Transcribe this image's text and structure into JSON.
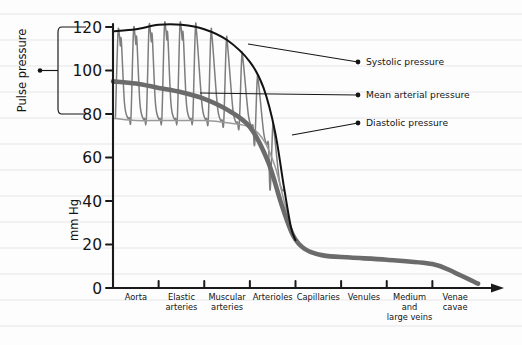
{
  "figure": {
    "y_axis_title": "mm Hg",
    "pulse_pressure_label": "Pulse pressure"
  },
  "annotations": [
    {
      "id": "systolic",
      "label": "Systolic pressure"
    },
    {
      "id": "mean",
      "label": "Mean arterial pressure"
    },
    {
      "id": "diastolic",
      "label": "Diastolic pressure"
    }
  ],
  "chart_data": {
    "type": "line",
    "title": "",
    "subtitle": "",
    "xlabel": "",
    "ylabel": "mm Hg",
    "ylim": [
      0,
      125
    ],
    "yticks": [
      0,
      20,
      40,
      60,
      80,
      100,
      120
    ],
    "ytick_labels": [
      "0",
      "20",
      "40",
      "60",
      "80",
      "100",
      "120"
    ],
    "grid": true,
    "legend_position": "inline-annotations",
    "categories": [
      "Aorta",
      "Elastic arteries",
      "Muscular arteries",
      "Arterioles",
      "Capillaries",
      "Venules",
      "Medium and large veins",
      "Venae cavae"
    ],
    "x_positions": [
      0.5,
      1.5,
      2.5,
      3.5,
      4.5,
      5.5,
      6.5,
      7.5
    ],
    "series": [
      {
        "name": "Systolic pressure",
        "color": "#121212",
        "x": [
          0.0,
          0.5,
          1.0,
          1.5,
          2.0,
          2.5,
          3.0,
          3.3,
          3.55,
          3.75,
          3.9,
          4.0
        ],
        "values": [
          118,
          119,
          121,
          121,
          119,
          114,
          104,
          92,
          72,
          46,
          28,
          22
        ]
      },
      {
        "name": "Mean arterial pressure",
        "color": "#6b6b6b",
        "x": [
          0.0,
          0.5,
          1.0,
          1.5,
          2.0,
          2.5,
          3.0,
          3.4,
          3.7,
          3.95,
          4.2,
          4.6,
          5.2,
          6.0,
          7.0,
          7.5,
          8.0
        ],
        "values": [
          95,
          94,
          92,
          90,
          87,
          82,
          74,
          58,
          38,
          24,
          18,
          15,
          14,
          13,
          11,
          7,
          2
        ]
      },
      {
        "name": "Diastolic pressure",
        "color": "#9a9a9a",
        "x": [
          0.0,
          0.5,
          1.0,
          1.5,
          2.0,
          2.5,
          3.0,
          3.3,
          3.55,
          3.75,
          3.9,
          4.0
        ],
        "values": [
          78,
          77,
          77,
          77,
          77,
          76,
          74,
          68,
          56,
          40,
          28,
          22
        ]
      }
    ],
    "pulse_waveform": {
      "description": "Pulsatile arterial pressure oscillating between diastolic and systolic envelopes",
      "color": "#7d7d7d",
      "n_cycles": 11,
      "x_start": 0.02,
      "x_end": 3.75,
      "systolic_peak_start": 118,
      "systolic_peak_end": 60,
      "diastolic_trough_start": 78,
      "diastolic_trough_end": 45
    },
    "pulse_pressure_bracket": {
      "top_value": 120,
      "bottom_value": 80,
      "label": "Pulse pressure"
    }
  }
}
